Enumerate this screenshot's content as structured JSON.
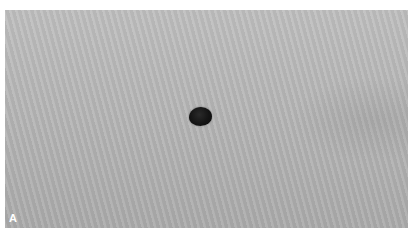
{
  "figure": {
    "panel_label": "A",
    "colors": {
      "skin": "#b4b4b4",
      "lesion": "#141414",
      "border": "#ffffff"
    }
  }
}
